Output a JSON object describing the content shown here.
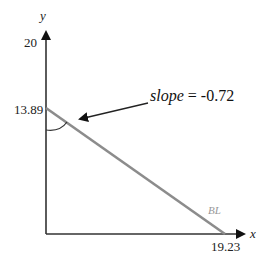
{
  "diagram": {
    "axes": {
      "x_label": "x",
      "y_label": "y",
      "y_max_tick": "20",
      "y_intercept_label": "13.89",
      "x_intercept_label": "19.23"
    },
    "line": {
      "label": "BL",
      "color": "#8c8c8c",
      "y_intercept": 13.89,
      "x_intercept": 19.23
    },
    "annotation": {
      "slope_word": "slope",
      "slope_eq": " = -0.72"
    },
    "colors": {
      "axis": "#333333",
      "text": "#222222"
    }
  }
}
